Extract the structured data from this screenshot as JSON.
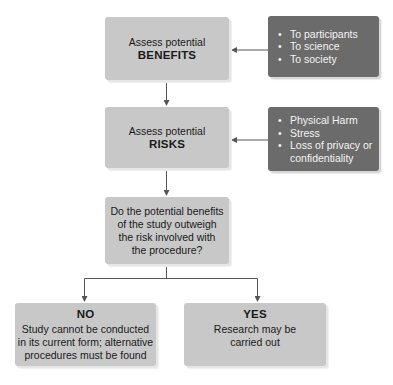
{
  "diagram": {
    "benefits": {
      "line1": "Assess potential",
      "line2": "BENEFITS",
      "details": [
        "To participants",
        "To science",
        "To society"
      ]
    },
    "risks": {
      "line1": "Assess potential",
      "line2": "RISKS",
      "details": [
        "Physical Harm",
        "Stress",
        "Loss of privacy or",
        "confidentiality"
      ]
    },
    "question": {
      "lines": [
        "Do the potential benefits",
        "of the study outweigh",
        "the risk involved with",
        "the procedure?"
      ]
    },
    "no": {
      "title": "NO",
      "lines": [
        "Study cannot be conducted",
        "in its current form; alternative",
        "procedures must be found"
      ]
    },
    "yes": {
      "title": "YES",
      "lines": [
        "Research may be",
        "carried out"
      ]
    },
    "colors": {
      "light_box": "#c8c8c8",
      "dark_box": "#6b6b6b",
      "connector": "#555555"
    }
  }
}
